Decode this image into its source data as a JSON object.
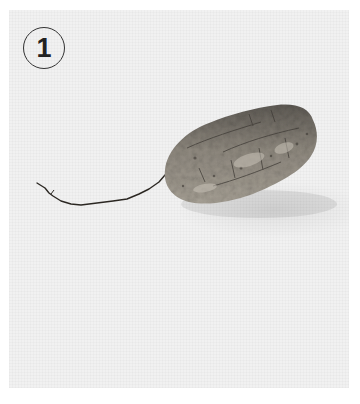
{
  "figure": {
    "step_number": "1",
    "background_color": "#f1f1f1",
    "tuber_tones": [
      "#6e6a63",
      "#8d877d",
      "#a8a297",
      "#4e4a44"
    ],
    "root_color": "#2b2722"
  }
}
